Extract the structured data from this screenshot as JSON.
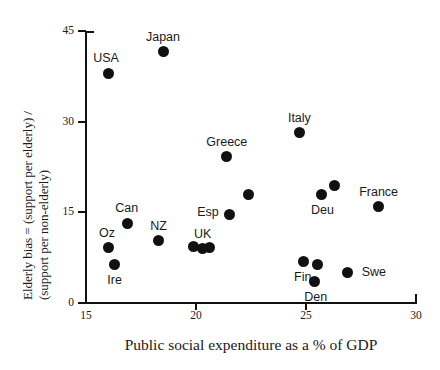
{
  "chart_data": {
    "type": "scatter",
    "title": "",
    "xlabel": "Public social expenditure as a % of GDP",
    "ylabel_line1": "Elderly bias = (support per elderly) /",
    "ylabel_line2": "(support per non-elderly)",
    "xlim": [
      15,
      30
    ],
    "ylim": [
      0,
      45
    ],
    "xticks": [
      "15",
      "20",
      "25",
      "30"
    ],
    "yticks": [
      "45",
      "30",
      "15",
      "0"
    ],
    "grid": false,
    "legend": "none",
    "marker_color": "#111111",
    "axis_color": "#111111",
    "points": [
      {
        "label": "USA",
        "x": 16.0,
        "y": 38.0,
        "label_dx": -2,
        "label_dy": -15
      },
      {
        "label": "Japan",
        "x": 18.5,
        "y": 41.6,
        "label_dx": 0,
        "label_dy": -15
      },
      {
        "label": "Italy",
        "x": 24.7,
        "y": 28.2,
        "label_dx": 0,
        "label_dy": -15
      },
      {
        "label": "Greece",
        "x": 21.4,
        "y": 24.2,
        "label_dx": 0,
        "label_dy": -15
      },
      {
        "label": "",
        "x": 22.4,
        "y": 17.9,
        "label_dx": 0,
        "label_dy": 0
      },
      {
        "label": "Esp",
        "x": 21.5,
        "y": 14.7,
        "label_dx": -21,
        "label_dy": -2
      },
      {
        "label": "Can",
        "x": 16.9,
        "y": 13.2,
        "label_dx": -1,
        "label_dy": -15
      },
      {
        "label": "NZ",
        "x": 18.3,
        "y": 10.3,
        "label_dx": 0,
        "label_dy": -15
      },
      {
        "label": "",
        "x": 19.9,
        "y": 9.3,
        "label_dx": 0,
        "label_dy": 0
      },
      {
        "label": "UK",
        "x": 20.3,
        "y": 9.0,
        "label_dx": 0,
        "label_dy": -15
      },
      {
        "label": "",
        "x": 20.6,
        "y": 9.2,
        "label_dx": 0,
        "label_dy": 0
      },
      {
        "label": "Oz",
        "x": 16.0,
        "y": 9.1,
        "label_dx": -1,
        "label_dy": -15
      },
      {
        "label": "Ire",
        "x": 16.3,
        "y": 6.3,
        "label_dx": 0,
        "label_dy": 15
      },
      {
        "label": "",
        "x": 26.3,
        "y": 19.5,
        "label_dx": 0,
        "label_dy": 0
      },
      {
        "label": "Deu",
        "x": 25.7,
        "y": 17.9,
        "label_dx": 1,
        "label_dy": 15
      },
      {
        "label": "France",
        "x": 28.3,
        "y": 15.9,
        "label_dx": 0,
        "label_dy": -15
      },
      {
        "label": "Fin",
        "x": 24.9,
        "y": 6.8,
        "label_dx": -1,
        "label_dy": 15
      },
      {
        "label": "",
        "x": 25.5,
        "y": 6.3,
        "label_dx": 0,
        "label_dy": 0
      },
      {
        "label": "Den",
        "x": 25.4,
        "y": 3.5,
        "label_dx": 1,
        "label_dy": 15
      },
      {
        "label": "Swe",
        "x": 26.9,
        "y": 5.1,
        "label_dx": 26,
        "label_dy": 0
      }
    ]
  }
}
